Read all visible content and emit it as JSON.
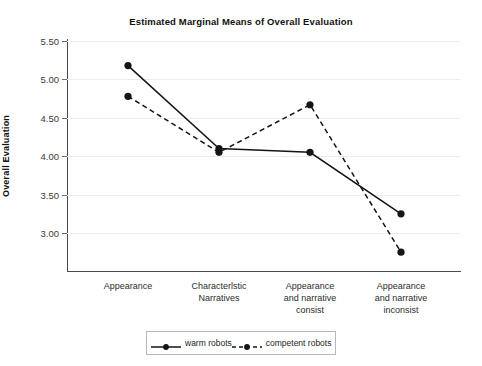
{
  "chart_data": {
    "type": "line",
    "title": "Estimated Marginal Means of Overall Evaluation",
    "xlabel": "",
    "ylabel": "Overall Evaluation",
    "categories": [
      "Appearance",
      "Characterlstic Narratives",
      "Appearance and narrative consist",
      "Appearance and narrative inconsist"
    ],
    "category_lines": [
      [
        "Appearance"
      ],
      [
        "Characterlstic",
        "Narratives"
      ],
      [
        "Appearance",
        "and narrative",
        "consist"
      ],
      [
        "Appearance",
        "and narrative",
        "inconsist"
      ]
    ],
    "series": [
      {
        "name": "warm robots",
        "style": "solid",
        "marker": "circle",
        "color": "#151515",
        "values": [
          5.18,
          4.1,
          4.05,
          3.25
        ]
      },
      {
        "name": "competent robots",
        "style": "dashed",
        "marker": "circle",
        "color": "#151515",
        "values": [
          4.78,
          4.05,
          4.67,
          2.75
        ]
      }
    ],
    "ylim": [
      2.6,
      5.5
    ],
    "yticks": [
      5.5,
      5.0,
      4.5,
      4.0,
      3.5,
      3.0
    ],
    "ytick_labels": [
      "5.50",
      "5.00",
      "4.50",
      "4.00",
      "3.50",
      "3.00"
    ],
    "grid": true,
    "grid_color": "#ececec",
    "legend_position": "bottom",
    "axis_color": "#4a4a4a",
    "background": "#ffffff"
  }
}
